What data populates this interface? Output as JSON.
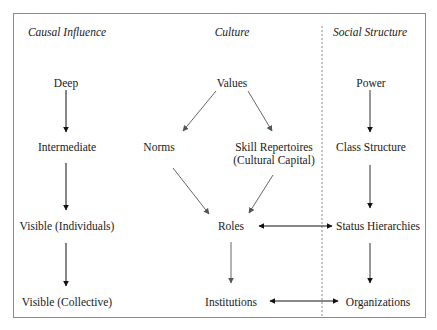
{
  "headers": {
    "causal_influence": "Causal Influence",
    "culture": "Culture",
    "social_structure": "Social Structure"
  },
  "causal_levels": {
    "deep": "Deep",
    "intermediate": "Intermediate",
    "visible_individuals": "Visible (Individuals)",
    "visible_collective": "Visible (Collective)"
  },
  "culture_nodes": {
    "values": "Values",
    "norms": "Norms",
    "skill_repertoires_line1": "Skill Repertoires",
    "skill_repertoires_line2": "(Cultural Capital)",
    "roles": "Roles",
    "institutions": "Institutions"
  },
  "social_nodes": {
    "power": "Power",
    "class_structure": "Class Structure",
    "status_hierarchies": "Status Hierarchies",
    "organizations": "Organizations"
  },
  "colors": {
    "frame": "#8a8a8a",
    "black_arrow": "#111111",
    "gray_arrow": "#666666",
    "divider": "#888888"
  }
}
